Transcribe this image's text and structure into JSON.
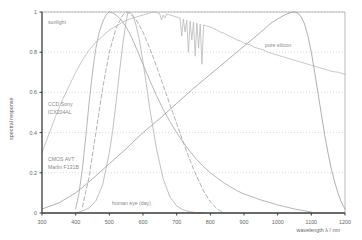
{
  "chart_data": {
    "type": "line",
    "title": "",
    "xlabel": "wavelength λ / nm",
    "ylabel": "spectral response",
    "xlim": [
      300,
      1200
    ],
    "ylim": [
      0,
      1
    ],
    "xticks": [
      300,
      400,
      500,
      600,
      700,
      800,
      900,
      1000,
      1100,
      1200
    ],
    "yticks": [
      0,
      0.2,
      0.4,
      0.6,
      0.8,
      1
    ],
    "xtick_labels": [
      "300",
      "400",
      "500",
      "600",
      "700",
      "800",
      "900",
      "1000",
      "1100",
      "1200"
    ],
    "ytick_labels": [
      "0",
      "0.2",
      "0.4",
      "0.6",
      "0.8",
      "1"
    ],
    "grid": true,
    "grid_style": "dotted-horizontal",
    "legend": "inline-annotations",
    "series": [
      {
        "name": "sunlight",
        "label": "sunlight",
        "color": "#b9b9b9",
        "style": "solid-jagged",
        "label_x": 385,
        "label_y": 0.93,
        "x": [
          300,
          320,
          340,
          360,
          380,
          400,
          420,
          440,
          460,
          480,
          500,
          520,
          540,
          560,
          580,
          600,
          610,
          620,
          630,
          640,
          650,
          655,
          660,
          665,
          670,
          680,
          690,
          700,
          710,
          715,
          720,
          725,
          730,
          735,
          740,
          745,
          750,
          755,
          760,
          765,
          770,
          775,
          780,
          790,
          800,
          810,
          820,
          830,
          840,
          850,
          860,
          870,
          880,
          890,
          900,
          910,
          920,
          930,
          940,
          950,
          960,
          970,
          980,
          990,
          1000,
          1020,
          1040,
          1060,
          1080,
          1100,
          1120,
          1140,
          1160,
          1180,
          1200
        ],
        "y": [
          0.3,
          0.39,
          0.48,
          0.56,
          0.63,
          0.7,
          0.76,
          0.81,
          0.85,
          0.88,
          0.91,
          0.93,
          0.95,
          0.965,
          0.975,
          0.985,
          0.99,
          0.995,
          1.0,
          0.998,
          0.99,
          0.96,
          0.985,
          0.97,
          0.99,
          0.985,
          0.98,
          0.975,
          0.97,
          0.88,
          0.965,
          0.9,
          0.96,
          0.8,
          0.955,
          0.86,
          0.95,
          0.78,
          0.945,
          0.82,
          0.94,
          0.74,
          0.935,
          0.93,
          0.925,
          0.918,
          0.91,
          0.9,
          0.895,
          0.885,
          0.878,
          0.87,
          0.86,
          0.855,
          0.845,
          0.84,
          0.835,
          0.825,
          0.82,
          0.815,
          0.81,
          0.8,
          0.795,
          0.79,
          0.785,
          0.775,
          0.765,
          0.755,
          0.745,
          0.735,
          0.725,
          0.715,
          0.705,
          0.7,
          0.69
        ]
      },
      {
        "name": "pure-silicon",
        "label": "pure silicon",
        "color": "#9a9a9a",
        "style": "solid",
        "label_x": 1005,
        "label_y": 0.9,
        "x": [
          300,
          350,
          400,
          450,
          500,
          550,
          600,
          650,
          700,
          750,
          800,
          850,
          900,
          950,
          980,
          1000,
          1020,
          1040,
          1050,
          1060,
          1070,
          1080,
          1090,
          1100,
          1110,
          1120,
          1130,
          1140,
          1150,
          1160,
          1170,
          1180,
          1190,
          1200
        ],
        "y": [
          0.02,
          0.05,
          0.1,
          0.17,
          0.245,
          0.32,
          0.4,
          0.47,
          0.545,
          0.62,
          0.69,
          0.76,
          0.83,
          0.9,
          0.945,
          0.965,
          0.985,
          0.998,
          1.0,
          0.995,
          0.975,
          0.94,
          0.88,
          0.8,
          0.7,
          0.595,
          0.49,
          0.385,
          0.295,
          0.215,
          0.15,
          0.095,
          0.05,
          0.02
        ]
      },
      {
        "name": "ccd-sony-icx204al",
        "label": "CCD Sony ICX204AL",
        "color": "#a3a3a3",
        "style": "solid",
        "label_x": 390,
        "label_y": 0.545,
        "x": [
          400,
          410,
          420,
          430,
          440,
          450,
          460,
          470,
          480,
          490,
          500,
          510,
          520,
          530,
          540,
          550,
          560,
          570,
          580,
          600,
          620,
          640,
          660,
          680,
          700,
          720,
          740,
          760,
          780,
          800,
          820,
          840,
          860,
          880,
          900,
          950,
          1000,
          1050,
          1100
        ],
        "y": [
          0.02,
          0.1,
          0.22,
          0.38,
          0.55,
          0.7,
          0.82,
          0.9,
          0.95,
          0.985,
          1.0,
          0.995,
          0.985,
          0.97,
          0.95,
          0.925,
          0.895,
          0.86,
          0.82,
          0.74,
          0.66,
          0.585,
          0.515,
          0.455,
          0.4,
          0.35,
          0.305,
          0.265,
          0.23,
          0.2,
          0.175,
          0.15,
          0.13,
          0.11,
          0.095,
          0.065,
          0.04,
          0.02,
          0.005
        ]
      },
      {
        "name": "cmos-avt-marlin-f131b",
        "label": "CMOS AVT Marlin F131B",
        "color": "#9f9f9f",
        "style": "dashed",
        "label_x": 385,
        "label_y": 0.3,
        "x": [
          420,
          440,
          460,
          480,
          500,
          520,
          540,
          550,
          560,
          580,
          600,
          620,
          640,
          660,
          680,
          700,
          720,
          740,
          760,
          780,
          800,
          820,
          840
        ],
        "y": [
          0.03,
          0.18,
          0.4,
          0.62,
          0.8,
          0.92,
          0.985,
          1.0,
          0.995,
          0.96,
          0.9,
          0.82,
          0.73,
          0.635,
          0.54,
          0.445,
          0.35,
          0.26,
          0.18,
          0.11,
          0.055,
          0.02,
          0.0
        ]
      },
      {
        "name": "human-eye-day",
        "label": "human eye (day)",
        "color": "#b0b0b0",
        "style": "solid",
        "label_x": 620,
        "label_y": 0.055,
        "x": [
          400,
          420,
          440,
          460,
          480,
          500,
          510,
          520,
          530,
          540,
          550,
          555,
          560,
          570,
          580,
          590,
          600,
          610,
          620,
          640,
          660,
          680,
          700,
          720,
          740,
          760,
          780
        ],
        "y": [
          0.0,
          0.01,
          0.025,
          0.06,
          0.14,
          0.3,
          0.41,
          0.55,
          0.7,
          0.84,
          0.955,
          0.995,
          1.0,
          0.985,
          0.93,
          0.855,
          0.75,
          0.64,
          0.52,
          0.32,
          0.17,
          0.08,
          0.035,
          0.015,
          0.006,
          0.002,
          0.0
        ]
      }
    ]
  },
  "axes": {
    "x_title": "wavelength λ / nm",
    "y_title": "spectral response"
  },
  "labels": {
    "sunlight": "sunlight",
    "pure_silicon": "pure silicon",
    "ccd_line1": "CCD Sony",
    "ccd_line2": "ICX204AL",
    "cmos_line1": "CMOS AVT",
    "cmos_line2": "Marlin F131B",
    "human_eye": "human eye (day)"
  },
  "colors": {
    "background": "#ffffff",
    "axis": "#3a3a3a",
    "frame": "#9b9b9b",
    "grid": "#c8c8c8",
    "text": "#666666",
    "label_text": "#8a8a8a"
  }
}
